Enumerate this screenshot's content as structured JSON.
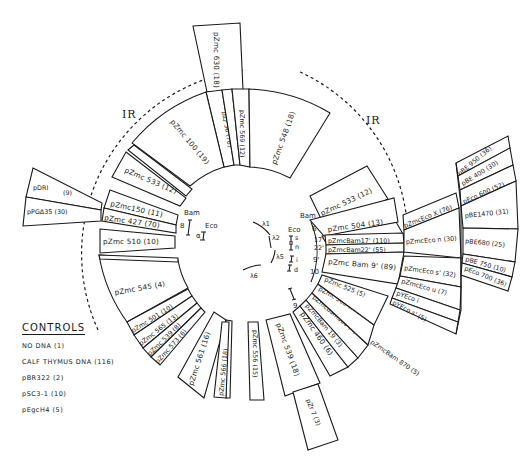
{
  "diagram": {
    "type": "circular restriction map of clone coverage",
    "ir_labels": [
      "IR",
      "IR"
    ],
    "center_markers": {
      "bam_left": "Bam",
      "eco_left": "Eco",
      "num_8": "8",
      "num_alpha": "α",
      "bam_right": "Bam",
      "eco_right": "Eco",
      "right_numbers": [
        "6",
        "17'",
        "22'",
        "9'",
        "10"
      ],
      "eco_letters": [
        "s",
        "n",
        "i",
        "d"
      ],
      "lambda_labels": [
        "λ1",
        "λ2",
        "λ5",
        "λ6"
      ],
      "num_9": "9"
    },
    "top": [
      {
        "label": "pZmc 630",
        "count": "(18)"
      },
      {
        "label": "pZ/ 36",
        "count": "(78)"
      },
      {
        "label": "pZmc 569",
        "count": "(12)"
      },
      {
        "label": "pZmc 548",
        "count": "(18)"
      },
      {
        "label": "pZmc 100",
        "count": "(19)"
      }
    ],
    "left": [
      {
        "label": "pZmc 533",
        "count": "(12)"
      },
      {
        "label": "pZmc150",
        "count": "(11)"
      },
      {
        "label": "pZmc 427",
        "count": "(70)"
      },
      {
        "label": "pZmc 510",
        "count": "(10)"
      },
      {
        "label": "pDRI",
        "count": "(9)"
      },
      {
        "label": "pPGΔ35",
        "count": "(30)"
      }
    ],
    "bottom_left": [
      {
        "label": "pZmc 545",
        "count": "(4)"
      },
      {
        "label": "pZmc 501",
        "count": "(10)"
      },
      {
        "label": "pZmc 565",
        "count": "(13)"
      },
      {
        "label": "pZmc 539",
        "count": "(8)"
      },
      {
        "label": "pZmc 573",
        "count": "(6)"
      },
      {
        "label": "pZmc 561",
        "count": "(16)"
      },
      {
        "label": "pZmc 566",
        "count": "(18)"
      },
      {
        "label": "pZmc 556",
        "count": "(15)"
      }
    ],
    "bottom_right": [
      {
        "label": "pZmc 539",
        "count": "(18)"
      },
      {
        "label": "pZr 7",
        "count": "(3)"
      },
      {
        "label": "pZmc 460",
        "count": "(6)"
      },
      {
        "label": "pZmcBam 19",
        "count": "(3)"
      },
      {
        "label": "pZmcBam500",
        "count": "(4)"
      },
      {
        "label": "pZmc 503",
        "count": "(11)"
      },
      {
        "label": "pZmc 525",
        "count": "(5)"
      },
      {
        "label": "pZmcBam 870",
        "count": "(5)"
      }
    ],
    "right": [
      {
        "label": "pZmc 533",
        "count": "(12)"
      },
      {
        "label": "pZmc 504",
        "count": "(13)"
      },
      {
        "label": "pZmcBam17'",
        "count": "(110)"
      },
      {
        "label": "pZmcBam22'",
        "count": "(55)"
      },
      {
        "label": "pZmc Bam 9'",
        "count": "(89)"
      },
      {
        "label": "pZmcEco X",
        "count": "(76)"
      },
      {
        "label": "pZmcEco n",
        "count": "(30)"
      },
      {
        "label": "pZmcEco s'",
        "count": "(32)"
      },
      {
        "label": "pZmcEco u",
        "count": "(7)"
      },
      {
        "label": "pYEco i",
        "count": ""
      },
      {
        "label": "pYEco s'",
        "count": "(5)"
      }
    ],
    "far_right": [
      {
        "label": "pBE 950",
        "count": "(36)"
      },
      {
        "label": "pBE 400",
        "count": "(30)"
      },
      {
        "label": "pEco 600",
        "count": "(52)"
      },
      {
        "label": "pBE1470",
        "count": "(31)"
      },
      {
        "label": "pBE680",
        "count": "(25)"
      },
      {
        "label": "pBE 750",
        "count": "(10)"
      },
      {
        "label": "pEco 700",
        "count": "(36)"
      }
    ]
  },
  "controls": {
    "title": "CONTROLS",
    "items": [
      "NO DNA (1)",
      "CALF THYMUS DNA (116)",
      "pBR322 (2)",
      "pSC3-1 (10)",
      "pEgcH4 (5)"
    ]
  }
}
